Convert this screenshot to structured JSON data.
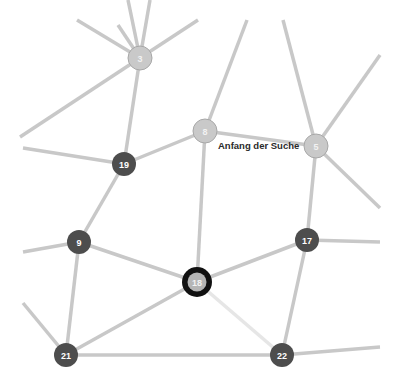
{
  "annotation": {
    "text": "Anfang der Suche",
    "x": 218,
    "y": 149
  },
  "colors": {
    "edge": "#c8c8c8",
    "edge_light": "#e6e6e6",
    "node_dark": "#4d4d4d",
    "node_light": "#c9c9c9",
    "current_ring": "#111111"
  },
  "nodes": [
    {
      "id": "3",
      "label": "3",
      "x": 140,
      "y": 58,
      "style": "light"
    },
    {
      "id": "8",
      "label": "8",
      "x": 205,
      "y": 131,
      "style": "light"
    },
    {
      "id": "5",
      "label": "5",
      "x": 316,
      "y": 146,
      "style": "light"
    },
    {
      "id": "19",
      "label": "19",
      "x": 124,
      "y": 164,
      "style": "dark"
    },
    {
      "id": "9",
      "label": "9",
      "x": 79,
      "y": 242,
      "style": "dark"
    },
    {
      "id": "17",
      "label": "17",
      "x": 307,
      "y": 240,
      "style": "dark"
    },
    {
      "id": "18",
      "label": "18",
      "x": 197,
      "y": 282,
      "style": "current"
    },
    {
      "id": "21",
      "label": "21",
      "x": 66,
      "y": 355,
      "style": "dark"
    },
    {
      "id": "22",
      "label": "22",
      "x": 282,
      "y": 355,
      "style": "dark"
    }
  ],
  "edges": [
    {
      "from": [
        140,
        58
      ],
      "to": [
        77,
        20
      ]
    },
    {
      "from": [
        140,
        58
      ],
      "to": [
        118,
        25
      ]
    },
    {
      "from": [
        140,
        58
      ],
      "to": [
        128,
        0
      ]
    },
    {
      "from": [
        140,
        58
      ],
      "to": [
        150,
        0
      ]
    },
    {
      "from": [
        140,
        58
      ],
      "to": [
        198,
        20
      ]
    },
    {
      "from": [
        140,
        58
      ],
      "to": [
        20,
        137
      ]
    },
    {
      "from": [
        140,
        58
      ],
      "to": [
        124,
        164
      ]
    },
    {
      "from": [
        205,
        131
      ],
      "to": [
        247,
        20
      ]
    },
    {
      "from": [
        205,
        131
      ],
      "to": [
        124,
        164
      ]
    },
    {
      "from": [
        205,
        131
      ],
      "to": [
        316,
        146
      ]
    },
    {
      "from": [
        205,
        131
      ],
      "to": [
        197,
        282
      ]
    },
    {
      "from": [
        316,
        146
      ],
      "to": [
        283,
        20
      ]
    },
    {
      "from": [
        316,
        146
      ],
      "to": [
        380,
        55
      ]
    },
    {
      "from": [
        316,
        146
      ],
      "to": [
        380,
        208
      ]
    },
    {
      "from": [
        316,
        146
      ],
      "to": [
        307,
        240
      ]
    },
    {
      "from": [
        124,
        164
      ],
      "to": [
        23,
        148
      ]
    },
    {
      "from": [
        124,
        164
      ],
      "to": [
        79,
        242
      ]
    },
    {
      "from": [
        79,
        242
      ],
      "to": [
        23,
        252
      ]
    },
    {
      "from": [
        79,
        242
      ],
      "to": [
        66,
        355
      ]
    },
    {
      "from": [
        79,
        242
      ],
      "to": [
        197,
        282
      ]
    },
    {
      "from": [
        307,
        240
      ],
      "to": [
        380,
        242
      ]
    },
    {
      "from": [
        307,
        240
      ],
      "to": [
        197,
        282
      ]
    },
    {
      "from": [
        307,
        240
      ],
      "to": [
        282,
        355
      ]
    },
    {
      "from": [
        197,
        282
      ],
      "to": [
        66,
        355
      ]
    },
    {
      "from": [
        197,
        282
      ],
      "to": [
        282,
        355
      ],
      "style": "light"
    },
    {
      "from": [
        66,
        355
      ],
      "to": [
        23,
        303
      ]
    },
    {
      "from": [
        66,
        355
      ],
      "to": [
        282,
        355
      ]
    },
    {
      "from": [
        282,
        355
      ],
      "to": [
        380,
        347
      ]
    }
  ]
}
